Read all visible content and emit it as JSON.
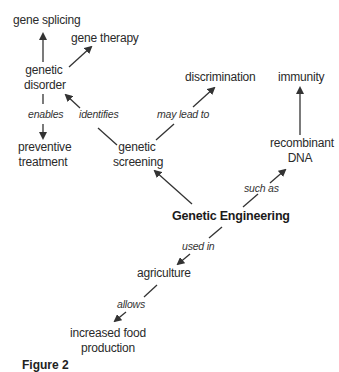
{
  "diagram": {
    "type": "concept-map",
    "central_concept": "Genetic Engineering",
    "nodes": {
      "gene_splicing": "gene splicing",
      "gene_therapy": "gene therapy",
      "genetic_disorder_1": "genetic",
      "genetic_disorder_2": "disorder",
      "discrimination": "discrimination",
      "immunity": "immunity",
      "preventive_treatment_1": "preventive",
      "preventive_treatment_2": "treatment",
      "genetic_screening_1": "genetic",
      "genetic_screening_2": "screening",
      "recombinant_dna_1": "recombinant",
      "recombinant_dna_2": "DNA",
      "genetic_engineering": "Genetic Engineering",
      "agriculture": "agriculture",
      "increased_food_production_1": "increased food",
      "increased_food_production_2": "production"
    },
    "link_labels": {
      "enables": "enables",
      "identifies": "identifies",
      "may_lead_to": "may lead to",
      "such_as": "such as",
      "used_in": "used in",
      "allows": "allows"
    },
    "edges": [
      {
        "from": "genetic disorder",
        "to": "gene splicing",
        "label": ""
      },
      {
        "from": "genetic disorder",
        "to": "gene therapy",
        "label": ""
      },
      {
        "from": "genetic disorder",
        "to": "preventive treatment",
        "label": "enables"
      },
      {
        "from": "genetic screening",
        "to": "genetic disorder",
        "label": "identifies"
      },
      {
        "from": "genetic screening",
        "to": "discrimination",
        "label": "may lead to"
      },
      {
        "from": "recombinant DNA",
        "to": "immunity",
        "label": ""
      },
      {
        "from": "Genetic Engineering",
        "to": "genetic screening",
        "label": ""
      },
      {
        "from": "Genetic Engineering",
        "to": "recombinant DNA",
        "label": "such as"
      },
      {
        "from": "Genetic Engineering",
        "to": "agriculture",
        "label": "used in"
      },
      {
        "from": "agriculture",
        "to": "increased food production",
        "label": "allows"
      }
    ],
    "caption": "Figure 2"
  }
}
